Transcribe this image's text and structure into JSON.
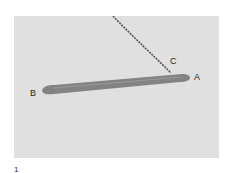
{
  "figure": {
    "number": "1",
    "labels": {
      "a": "A",
      "b": "B",
      "c": "C"
    },
    "colors": {
      "background": "#dedede",
      "needle": "#7a7a7a",
      "thread": "#555555"
    }
  }
}
